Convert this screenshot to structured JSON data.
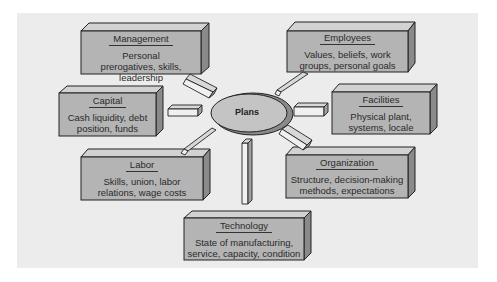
{
  "diagram": {
    "center": {
      "label": "Plans"
    },
    "boxes": [
      {
        "id": "management",
        "title": "Management",
        "description": "Personal prerogatives, skills, leadership"
      },
      {
        "id": "employees",
        "title": "Employees",
        "description": "Values, beliefs, work groups, personal goals"
      },
      {
        "id": "capital",
        "title": "Capital",
        "description": "Cash liquidity, debt position, funds"
      },
      {
        "id": "facilities",
        "title": "Facilities",
        "description": "Physical plant, systems, locale"
      },
      {
        "id": "labor",
        "title": "Labor",
        "description": "Skills, union, labor relations, wage costs"
      },
      {
        "id": "organization",
        "title": "Organization",
        "description": "Structure, decision-making methods, expectations"
      },
      {
        "id": "technology",
        "title": "Technology",
        "description": "State of manufacturing, service, capacity, condition"
      }
    ],
    "colors": {
      "background": "#ececec",
      "box_front": "#b4b4b4",
      "box_top": "#d2d2d2",
      "box_side": "#8a8a8a",
      "outline": "#222222"
    }
  }
}
